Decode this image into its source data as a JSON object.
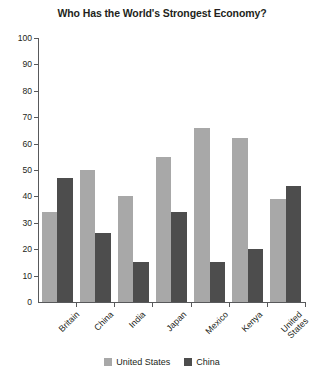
{
  "chart_data": {
    "type": "bar",
    "title": "Who Has the World's Strongest Economy?",
    "xlabel": "",
    "ylabel": "",
    "ylim": [
      0,
      100
    ],
    "ytick_step": 10,
    "yticks": [
      "100",
      "90",
      "80",
      "70",
      "60",
      "50",
      "40",
      "30",
      "20",
      "10",
      "0"
    ],
    "grid": false,
    "legend_position": "bottom-center",
    "categories": [
      "Britain",
      "China",
      "India",
      "Japan",
      "Mexico",
      "Kenya",
      "United States"
    ],
    "series": [
      {
        "name": "United States",
        "color": "#a8a8a8",
        "values": [
          34,
          50,
          40,
          55,
          66,
          62,
          39
        ]
      },
      {
        "name": "China",
        "color": "#4d4d4d",
        "values": [
          47,
          26,
          15,
          34,
          15,
          20,
          44
        ]
      }
    ]
  },
  "legend": {
    "items": [
      {
        "label": "United States"
      },
      {
        "label": "China"
      }
    ]
  },
  "category_labels": {
    "l0": "Britain",
    "l1": "China",
    "l2": "India",
    "l3": "Japan",
    "l4": "Mexico",
    "l5": "Kenya",
    "l6_line1": "United",
    "l6_line2": "States"
  }
}
